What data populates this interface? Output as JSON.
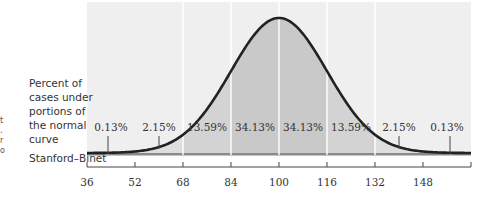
{
  "side_label": {
    "lines": [
      "Percent of",
      "cases under",
      "portions of",
      "the normal",
      "curve"
    ]
  },
  "scale_label": "Stanford–Binet",
  "edge_glyphs": [
    "t",
    ".",
    "r",
    "o"
  ],
  "colors": {
    "background": "#efefef",
    "shade_inner": "#c9c9c9",
    "shade_mid": "#d3d3d3",
    "shade_outer": "#dedede",
    "curve": "#222222",
    "divider": "#ffffff",
    "axis": "#444444",
    "text": "#333333"
  },
  "chart_data": {
    "type": "area",
    "title": "",
    "distribution": "normal",
    "mean": 100,
    "sd": 16,
    "xlabel": "Stanford–Binet",
    "ylabel": "Percent of cases under portions of the normal curve",
    "xlim": [
      36,
      164
    ],
    "x_ticks": [
      36,
      52,
      68,
      84,
      100,
      116,
      132,
      148
    ],
    "tick_labels": [
      "36",
      "52",
      "68",
      "84",
      "100",
      "116",
      "132",
      "148"
    ],
    "dividers": [
      68,
      84,
      100,
      116,
      132
    ],
    "segments": [
      {
        "range": [
          36,
          52
        ],
        "percent": 0.13,
        "label": "0.13%"
      },
      {
        "range": [
          52,
          68
        ],
        "percent": 2.15,
        "label": "2.15%"
      },
      {
        "range": [
          68,
          84
        ],
        "percent": 13.59,
        "label": "13.59%"
      },
      {
        "range": [
          84,
          100
        ],
        "percent": 34.13,
        "label": "34.13%"
      },
      {
        "range": [
          100,
          116
        ],
        "percent": 34.13,
        "label": "34.13%"
      },
      {
        "range": [
          116,
          132
        ],
        "percent": 13.59,
        "label": "13.59%"
      },
      {
        "range": [
          132,
          148
        ],
        "percent": 2.15,
        "label": "2.15%"
      },
      {
        "range": [
          148,
          164
        ],
        "percent": 0.13,
        "label": "0.13%"
      }
    ],
    "grid": false,
    "legend": null
  }
}
